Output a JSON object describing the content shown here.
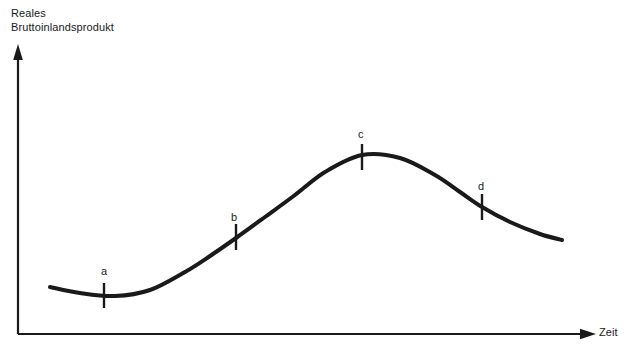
{
  "figure": {
    "width": 630,
    "height": 350,
    "background_color": "#ffffff",
    "ink_color": "#1a1a1a"
  },
  "axes": {
    "y_title_line1": "Reales",
    "y_title_line2": "Bruttoinlandsprodukt",
    "x_title": "Zeit",
    "y_axis_name": "vertical-axis-arrow",
    "x_axis_name": "horizontal-axis-arrow"
  },
  "labels": {
    "a": "a",
    "b": "b",
    "c": "c",
    "d": "d"
  },
  "chart_data": {
    "type": "line",
    "title": "",
    "subtitle": "",
    "xlabel": "Zeit",
    "ylabel": "Reales Bruttoinlandsprodukt",
    "grid": false,
    "legend": "none",
    "axis_style": "arrow-axes-unlabeled-ticks",
    "xlim": [
      0,
      630
    ],
    "ylim": [
      0,
      350
    ],
    "series": [
      {
        "name": "Reales Bruttoinlandsprodukt",
        "color": "#1a1a1a",
        "line_width": 4,
        "points": [
          {
            "x": 50,
            "y": 287
          },
          {
            "x": 80,
            "y": 293
          },
          {
            "x": 115,
            "y": 296
          },
          {
            "x": 150,
            "y": 290
          },
          {
            "x": 185,
            "y": 272
          },
          {
            "x": 210,
            "y": 256
          },
          {
            "x": 236,
            "y": 238
          },
          {
            "x": 265,
            "y": 217
          },
          {
            "x": 295,
            "y": 195
          },
          {
            "x": 325,
            "y": 172
          },
          {
            "x": 362,
            "y": 155
          },
          {
            "x": 400,
            "y": 158
          },
          {
            "x": 435,
            "y": 175
          },
          {
            "x": 460,
            "y": 192
          },
          {
            "x": 482,
            "y": 207
          },
          {
            "x": 510,
            "y": 222
          },
          {
            "x": 540,
            "y": 234
          },
          {
            "x": 562,
            "y": 240
          }
        ]
      }
    ],
    "annotations": [
      {
        "label": "a",
        "phase": "trough",
        "x": 104,
        "y": 296,
        "label_x": 101,
        "label_y": 265,
        "tick_top": 283,
        "tick_bottom": 308
      },
      {
        "label": "b",
        "phase": "expansion",
        "x": 236,
        "y": 238,
        "label_x": 231,
        "label_y": 211,
        "tick_top": 224,
        "tick_bottom": 250
      },
      {
        "label": "c",
        "phase": "peak",
        "x": 362,
        "y": 155,
        "label_x": 358,
        "label_y": 128,
        "tick_top": 144,
        "tick_bottom": 170
      },
      {
        "label": "d",
        "phase": "contraction",
        "x": 482,
        "y": 207,
        "label_x": 478,
        "label_y": 180,
        "tick_top": 194,
        "tick_bottom": 220
      }
    ]
  }
}
